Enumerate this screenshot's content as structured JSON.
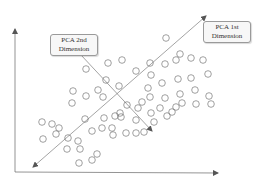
{
  "diagram": {
    "labels": {
      "pca2": {
        "line1": "PCA 2nd",
        "line2": "Dimension"
      },
      "pca1": {
        "line1": "PCA 1st",
        "line2": "Dimension"
      }
    },
    "colors": {
      "axis": "#555555",
      "pc_line": "#666666",
      "point_stroke": "#777777",
      "label_border": "#9a9a9a"
    },
    "points_count": 66
  }
}
